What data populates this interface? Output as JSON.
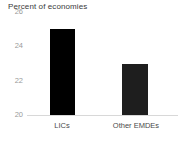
{
  "chart_data": {
    "type": "bar",
    "title": "Percent of economies",
    "xlabel": "",
    "ylabel": "",
    "categories": [
      "LICs",
      "Other EMDEs"
    ],
    "values": [
      25.0,
      23.0
    ],
    "ylim": [
      20,
      26
    ],
    "yticks": [
      20,
      22,
      24,
      26
    ],
    "ytick_labels": [
      "20",
      "22",
      "24",
      "26"
    ],
    "grid": false,
    "legend": null,
    "bar_colors": [
      "#000000",
      "#1e1e1e"
    ],
    "background_color": "#ffffff",
    "axis_color": "#d8d8d8",
    "tick_label_color": "#9a9a9a",
    "category_label_color": "#4a4a4a",
    "title_color": "#3a3a3a"
  }
}
